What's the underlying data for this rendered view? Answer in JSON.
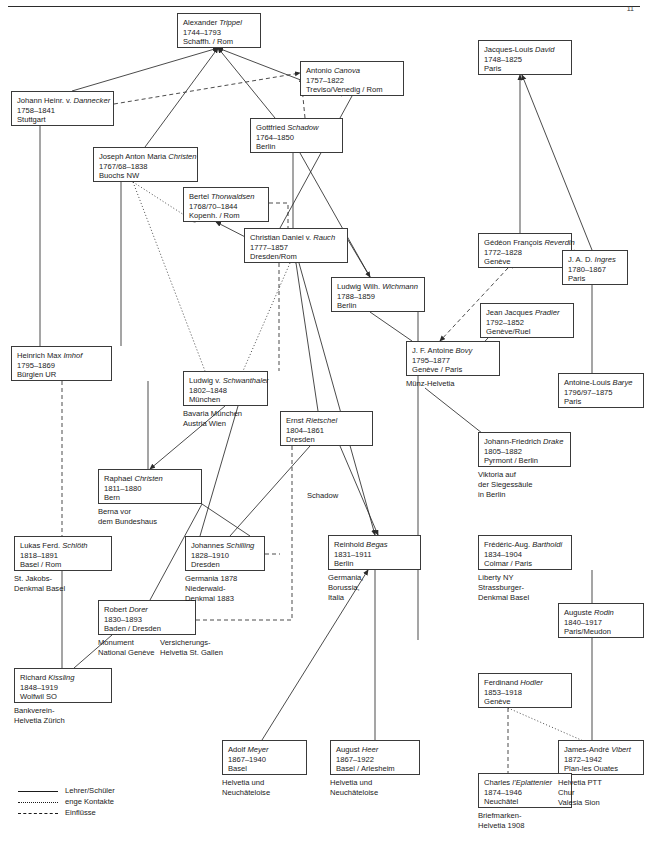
{
  "page": {
    "number": "11"
  },
  "legend": {
    "items": [
      {
        "style": "solid",
        "label": "Lehrer/Schüler"
      },
      {
        "style": "dotted",
        "label": "enge Kontakte"
      },
      {
        "style": "dashed",
        "label": "Einflüsse"
      }
    ]
  },
  "edge_labels": [
    {
      "id": "schadow-label",
      "text": "Schadow",
      "x": 306,
      "y": 491
    }
  ],
  "nodes": [
    {
      "id": "trippel",
      "name_plain": "Alexander ",
      "name_ital": "Trippel",
      "years": "1744–1793",
      "place": "Schaffh. / Rom",
      "x": 177,
      "y": 13,
      "w": 84,
      "h": 35
    },
    {
      "id": "dannecker",
      "name_plain": "Johann Heinr. v. ",
      "name_ital": "Dannecker",
      "years": "1758–1841",
      "place": "Stuttgart",
      "x": 11,
      "y": 91,
      "w": 103,
      "h": 35
    },
    {
      "id": "canova",
      "name_plain": "Antonio ",
      "name_ital": "Canova",
      "years": "1757–1822",
      "place": "Treviso/Venedig / Rom",
      "x": 300,
      "y": 61,
      "w": 104,
      "h": 35
    },
    {
      "id": "schadow",
      "name_plain": "Gottfried ",
      "name_ital": "Schadow",
      "years": "1764–1850",
      "place": "Berlin",
      "x": 250,
      "y": 118,
      "w": 93,
      "h": 35
    },
    {
      "id": "jam-christen",
      "name_plain": "Joseph Anton Maria ",
      "name_ital": "Christen",
      "years": "1767/68–1838",
      "place": "Buochs NW",
      "x": 93,
      "y": 147,
      "w": 105,
      "h": 35
    },
    {
      "id": "thorwaldsen",
      "name_plain": "Bertel ",
      "name_ital": "Thorwaldsen",
      "years": "1768/70–1844",
      "place": "Kopenh. / Rom",
      "x": 183,
      "y": 187,
      "w": 86,
      "h": 35
    },
    {
      "id": "rauch",
      "name_plain": "Christian Daniel v. ",
      "name_ital": "Rauch",
      "years": "1777–1857",
      "place": "Dresden/Rom",
      "x": 244,
      "y": 228,
      "w": 104,
      "h": 35
    },
    {
      "id": "wichmann",
      "name_plain": "Ludwig Wilh. ",
      "name_ital": "Wichmann",
      "years": "1788–1859",
      "place": "Berlin",
      "x": 331,
      "y": 277,
      "w": 94,
      "h": 35
    },
    {
      "id": "david",
      "name_plain": "Jacques-Louis ",
      "name_ital": "David",
      "years": "1748–1825",
      "place": "Paris",
      "x": 478,
      "y": 40,
      "w": 94,
      "h": 35
    },
    {
      "id": "reverdin",
      "name_plain": "Gédéon François ",
      "name_ital": "Reverdin",
      "years": "1772–1828",
      "place": "Genève",
      "x": 478,
      "y": 233,
      "w": 94,
      "h": 35
    },
    {
      "id": "ingres",
      "name_plain": "J. A. D. ",
      "name_ital": "Ingres",
      "years": "1780–1867",
      "place": "Paris",
      "x": 562,
      "y": 250,
      "w": 66,
      "h": 35
    },
    {
      "id": "pradier",
      "name_plain": "Jean Jacques ",
      "name_ital": "Pradier",
      "years": "1792–1852",
      "place": "Genève/Ruel",
      "x": 480,
      "y": 303,
      "w": 94,
      "h": 35
    },
    {
      "id": "bovy",
      "name_plain": "J. F. Antoine ",
      "name_ital": "Bovy",
      "years": "1795–1877",
      "place": "Genève / Paris",
      "x": 406,
      "y": 341,
      "w": 94,
      "h": 35
    },
    {
      "id": "barye",
      "name_plain": "Antoine-Louis ",
      "name_ital": "Barye",
      "years": "1796/97–1875",
      "place": "Paris",
      "x": 558,
      "y": 373,
      "w": 86,
      "h": 35
    },
    {
      "id": "drake",
      "name_plain": "Johann-Friedrich ",
      "name_ital": "Drake",
      "years": "1805–1882",
      "place": "Pyrmont / Berlin",
      "x": 478,
      "y": 432,
      "w": 93,
      "h": 35
    },
    {
      "id": "imhof",
      "name_plain": "Heinrich Max ",
      "name_ital": "Imhof",
      "years": "1795–1869",
      "place": "Bürglen UR",
      "x": 11,
      "y": 346,
      "w": 101,
      "h": 35
    },
    {
      "id": "schwanthaler",
      "name_plain": "Ludwig v. ",
      "name_ital": "Schwanthaler",
      "years": "1802–1848",
      "place": "München",
      "x": 183,
      "y": 371,
      "w": 85,
      "h": 35
    },
    {
      "id": "rietschel",
      "name_plain": "Ernst ",
      "name_ital": "Rietschel",
      "years": "1804–1861",
      "place": "Dresden",
      "x": 280,
      "y": 411,
      "w": 93,
      "h": 35
    },
    {
      "id": "raphael-christen",
      "name_plain": "Raphael ",
      "name_ital": "Christen",
      "years": "1811–1880",
      "place": "Bern",
      "x": 98,
      "y": 469,
      "w": 104,
      "h": 35
    },
    {
      "id": "schloth",
      "name_plain": "Lukas Ferd. ",
      "name_ital": "Schlöth",
      "years": "1818–1891",
      "place": "Basel / Rom",
      "x": 14,
      "y": 536,
      "w": 98,
      "h": 35
    },
    {
      "id": "schilling",
      "name_plain": "Johannes ",
      "name_ital": "Schilling",
      "years": "1828–1910",
      "place": "Dresden",
      "x": 185,
      "y": 536,
      "w": 80,
      "h": 35
    },
    {
      "id": "begas",
      "name_plain": "Reinhold ",
      "name_ital": "Begas",
      "years": "1831–1911",
      "place": "Berlin",
      "x": 328,
      "y": 535,
      "w": 93,
      "h": 35
    },
    {
      "id": "bartholdi",
      "name_plain": "Frédéric-Aug. ",
      "name_ital": "Bartholdi",
      "years": "1834–1904",
      "place": "Colmar / Paris",
      "x": 478,
      "y": 535,
      "w": 94,
      "h": 35
    },
    {
      "id": "dorer",
      "name_plain": "Robert ",
      "name_ital": "Dorer",
      "years": "1830–1893",
      "place": "Baden / Dresden",
      "x": 98,
      "y": 600,
      "w": 98,
      "h": 35
    },
    {
      "id": "rodin",
      "name_plain": "Auguste ",
      "name_ital": "Rodin",
      "years": "1840–1917",
      "place": "Paris/Meudon",
      "x": 558,
      "y": 603,
      "w": 86,
      "h": 35
    },
    {
      "id": "kissling",
      "name_plain": "Richard ",
      "name_ital": "Kissling",
      "years": "1848–1919",
      "place": "Wolfwil SO",
      "x": 14,
      "y": 668,
      "w": 98,
      "h": 35
    },
    {
      "id": "hodler",
      "name_plain": "Ferdinand ",
      "name_ital": "Hodler",
      "years": "1853–1918",
      "place": "Genève",
      "x": 478,
      "y": 673,
      "w": 94,
      "h": 35
    },
    {
      "id": "vibert",
      "name_plain": "James-André ",
      "name_ital": "Vibert",
      "years": "1872–1942",
      "place": "Plan-les Ouates",
      "x": 558,
      "y": 740,
      "w": 86,
      "h": 35
    },
    {
      "id": "meyer",
      "name_plain": "Adolf ",
      "name_ital": "Meyer",
      "years": "1867–1940",
      "place": "Basel",
      "x": 222,
      "y": 740,
      "w": 85,
      "h": 35
    },
    {
      "id": "heer",
      "name_plain": "August ",
      "name_ital": "Heer",
      "years": "1867–1922",
      "place": "Basel / Arlesheim",
      "x": 330,
      "y": 740,
      "w": 90,
      "h": 35
    },
    {
      "id": "leplattenier",
      "name_plain": "Charles ",
      "name_ital": "l’Eplattenier",
      "years": "1874–1946",
      "place": "Neuchâtel",
      "x": 478,
      "y": 773,
      "w": 94,
      "h": 35
    }
  ],
  "captions": [
    {
      "id": "bovy-works",
      "text": "Münz-Helvetia",
      "x": 406,
      "y": 379
    },
    {
      "id": "schwanthaler-works",
      "text": "Bavaria München\nAustria Wien",
      "x": 183,
      "y": 409
    },
    {
      "id": "raphael-works",
      "text": "Berna vor\ndem Bundeshaus",
      "x": 98,
      "y": 507
    },
    {
      "id": "drake-works",
      "text": "Viktoria auf\nder Siegessäule\nin Berlin",
      "x": 478,
      "y": 470
    },
    {
      "id": "schloth-works",
      "text": "St. Jakobs-\nDenkmal Basel",
      "x": 14,
      "y": 574
    },
    {
      "id": "schilling-works",
      "text": "Germania 1878\nNiederwald-\nDenkmal 1883",
      "x": 185,
      "y": 574
    },
    {
      "id": "begas-works",
      "text": "Germania,\nBorussia,\nItalia",
      "x": 328,
      "y": 573
    },
    {
      "id": "bartholdi-works",
      "text": "Liberty NY\nStrassburger-\nDenkmal Basel",
      "x": 478,
      "y": 573
    },
    {
      "id": "dorer-works",
      "text": "Monument\nNational Genève",
      "x": 98,
      "y": 638
    },
    {
      "id": "dorer-works2",
      "text": "Versicherungs-\nHelvetia St. Gallen",
      "x": 160,
      "y": 638
    },
    {
      "id": "kissling-works",
      "text": "Bankverein-\nHelvetia Zürich",
      "x": 14,
      "y": 706
    },
    {
      "id": "vibert-works",
      "text": "Helvetia PTT\nChur\nValesia Sion",
      "x": 558,
      "y": 778
    },
    {
      "id": "meyer-works",
      "text": "Helvetia und\nNeuchâteloise",
      "x": 222,
      "y": 778
    },
    {
      "id": "heer-works",
      "text": "Helvetia und\nNeuchâteloise",
      "x": 330,
      "y": 778
    },
    {
      "id": "leplattenier-works",
      "text": "Briefmarken-\nHelvetia 1908",
      "x": 478,
      "y": 811
    }
  ],
  "edges": [
    {
      "from": "trippel",
      "to": "dannecker",
      "style": "solid",
      "arrow": "to-trippel",
      "path": "M 72 91 L 218 48"
    },
    {
      "from": "trippel",
      "to": "jam-christen",
      "style": "solid",
      "arrow": "to-trippel",
      "path": "M 145 147 L 218 48"
    },
    {
      "from": "trippel",
      "to": "schadow",
      "style": "solid",
      "arrow": "to-trippel",
      "path": "M 275 118 L 218 48"
    },
    {
      "from": "trippel",
      "to": "canova",
      "style": "solid",
      "arrow": "to-trippel",
      "path": "M 342 96 L 218 48"
    },
    {
      "from": "dannecker",
      "to": "canova",
      "style": "dashed",
      "arrow": "to-canova",
      "path": "M 114 104 L 300 73"
    },
    {
      "from": "schadow",
      "to": "canova",
      "style": "dashed",
      "arrow": "to-canova",
      "path": "M 305 118 L 301 77"
    },
    {
      "from": "dannecker",
      "to": "imhof",
      "style": "solid",
      "arrow": "none",
      "path": "M 40 126 L 40 346"
    },
    {
      "from": "jam-christen",
      "to": "thorwaldsen",
      "style": "dotted",
      "arrow": "to-thorwaldsen",
      "path": "M 133 182 L 195 222"
    },
    {
      "from": "jam-christen",
      "to": "schwanthaler",
      "style": "dotted",
      "arrow": "none",
      "path": "M 133 182 L 205 371"
    },
    {
      "from": "jam-christen",
      "to": "imhof",
      "style": "solid",
      "arrow": "none",
      "path": "M 121 182 L 121 346"
    },
    {
      "from": "schadow",
      "to": "rauch",
      "style": "solid",
      "arrow": "none",
      "path": "M 293 153 L 293 228"
    },
    {
      "from": "schadow",
      "to": "wichmann",
      "style": "solid",
      "arrow": "none",
      "path": "M 300 153 L 370 277"
    },
    {
      "from": "canova",
      "to": "rauch",
      "style": "solid",
      "arrow": "none",
      "path": "M 352 96 L 280 228"
    },
    {
      "from": "thorwaldsen",
      "to": "rauch",
      "style": "dashed",
      "arrow": "none",
      "path": "M 269 203 L 288 203 L 288 228"
    },
    {
      "from": "rauch",
      "to": "wichmann",
      "style": "solid",
      "arrow": "to-wichmann",
      "path": "M 348 240 L 370 277"
    },
    {
      "from": "rauch",
      "to": "thorwaldsen",
      "style": "solid",
      "arrow": "to-thorwaldsen",
      "path": "M 296 263 L 216 222"
    },
    {
      "from": "rauch",
      "to": "schwanthaler",
      "style": "dashed",
      "arrow": "none",
      "path": "M 279 263 L 279 371"
    },
    {
      "from": "rauch",
      "to": "imhof",
      "style": "dotted",
      "arrow": "none",
      "path": "M 290 263 L 243 371"
    },
    {
      "from": "rauch",
      "to": "rietschel",
      "style": "solid",
      "arrow": "none",
      "path": "M 296 263 L 318 411"
    },
    {
      "from": "rauch",
      "to": "begas",
      "style": "solid",
      "arrow": "to-begas",
      "path": "M 299 263 L 375 535"
    },
    {
      "from": "david",
      "to": "reverdin",
      "style": "solid",
      "arrow": "to-david",
      "path": "M 520 233 L 520 75"
    },
    {
      "from": "david",
      "to": "ingres",
      "style": "solid",
      "arrow": "to-david",
      "path": "M 592 250 L 522 75"
    },
    {
      "from": "reverdin",
      "to": "ingres",
      "style": "dotted",
      "arrow": "none",
      "path": "M 512 268 L 575 250"
    },
    {
      "from": "reverdin",
      "to": "bovy",
      "style": "dashed",
      "arrow": "to-bovy",
      "path": "M 508 268 L 440 341"
    },
    {
      "from": "ingres",
      "to": "barye",
      "style": "solid",
      "arrow": "none",
      "path": "M 592 285 L 592 373"
    },
    {
      "from": "pradier",
      "to": "bovy",
      "style": "solid",
      "arrow": "none",
      "path": "M 488 338 L 452 376"
    },
    {
      "from": "bovy",
      "to": "drake",
      "style": "solid",
      "arrow": "to-drake",
      "path": "M 425 388 L 487 437"
    },
    {
      "from": "wichmann",
      "to": "bovy",
      "style": "solid",
      "arrow": "none",
      "path": "M 370 312 L 412 341"
    },
    {
      "from": "wichmann",
      "to": "drake",
      "style": "solid",
      "arrow": "none",
      "path": "M 418 312 L 418 640"
    },
    {
      "from": "imhof",
      "to": "schloth",
      "style": "dashed",
      "arrow": "none",
      "path": "M 62 381 L 62 536"
    },
    {
      "from": "imhof",
      "to": "raphael-christen",
      "style": "solid",
      "arrow": "none",
      "path": "M 148 381 L 148 469"
    },
    {
      "from": "schwanthaler",
      "to": "raphael-christen",
      "style": "solid",
      "arrow": "to-raphael",
      "path": "M 225 406 L 150 469"
    },
    {
      "from": "schwanthaler",
      "to": "schilling",
      "style": "solid",
      "arrow": "none",
      "path": "M 238 406 L 200 536"
    },
    {
      "from": "rietschel",
      "to": "schilling",
      "style": "solid",
      "arrow": "none",
      "path": "M 310 446 L 230 536"
    },
    {
      "from": "rietschel",
      "to": "begas",
      "style": "solid",
      "arrow": "to-begas",
      "path": "M 340 446 L 378 535"
    },
    {
      "from": "rietschel",
      "to": "dorer",
      "style": "dashed",
      "arrow": "none",
      "path": "M 292 446 L 292 620 L 196 620"
    },
    {
      "from": "schilling",
      "to": "dorer",
      "style": "dashed",
      "arrow": "none",
      "path": "M 265 554 L 280 554"
    },
    {
      "from": "raphael-christen",
      "to": "dorer",
      "style": "solid",
      "arrow": "none",
      "path": "M 202 504 L 150 600"
    },
    {
      "from": "raphael-christen",
      "to": "schilling",
      "style": "solid",
      "arrow": "none",
      "path": "M 202 504 L 250 536"
    },
    {
      "from": "schloth",
      "to": "kissling",
      "style": "solid",
      "arrow": "none",
      "path": "M 62 571 L 62 668"
    },
    {
      "from": "dorer",
      "to": "kissling",
      "style": "solid",
      "arrow": "none",
      "path": "M 112 635 L 74 668"
    },
    {
      "from": "begas",
      "to": "meyer",
      "style": "solid",
      "arrow": "to-begas",
      "path": "M 262 740 L 368 570"
    },
    {
      "from": "begas",
      "to": "heer",
      "style": "solid",
      "arrow": "none",
      "path": "M 375 570 L 375 740"
    },
    {
      "from": "bartholdi",
      "to": "rodin",
      "style": "solid",
      "arrow": "none",
      "path": "M 592 570 L 592 603"
    },
    {
      "from": "rodin",
      "to": "vibert",
      "style": "solid",
      "arrow": "none",
      "path": "M 592 638 L 592 740"
    },
    {
      "from": "hodler",
      "to": "vibert",
      "style": "dotted",
      "arrow": "none",
      "path": "M 508 708 L 588 743"
    },
    {
      "from": "hodler",
      "to": "leplattenier",
      "style": "dashed",
      "arrow": "none",
      "path": "M 508 708 L 508 773"
    }
  ]
}
